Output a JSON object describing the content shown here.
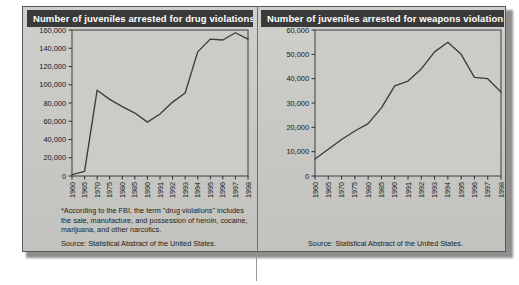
{
  "figure": {
    "panels": [
      {
        "id": "drug-violations",
        "title": "Number of juveniles arrested for drug violations*",
        "footnote": "*According to the FBI, the term \"drug violations\" includes the sale, manufacture, and possession of heroin, cocaine, marijuana, and other narcotics.",
        "source": "Source: Statistical Abstract of the United States."
      },
      {
        "id": "weapons-violations",
        "title": "Number of juveniles arrested for weapons violations",
        "footnote": "",
        "source": "Source: Statistical Abstract of the United States."
      }
    ],
    "colors": {
      "title_bar": "#3a3a3a",
      "title_text": "#ffffff",
      "panel_background": "#c9c9c5",
      "line": "#3c3c3c",
      "axis": "#3d3d3d",
      "frame_border": "#5a5a58"
    }
  },
  "chart_data": [
    {
      "type": "line",
      "title": "Number of juveniles arrested for drug violations*",
      "xlabel": "",
      "ylabel": "",
      "ylim": [
        0,
        160000
      ],
      "yticks": [
        0,
        20000,
        40000,
        60000,
        80000,
        100000,
        120000,
        140000,
        160000
      ],
      "ytick_labels": [
        "0",
        "20,000",
        "40,000",
        "60,000",
        "80,000",
        "100,000",
        "120,000",
        "140,000",
        "160,000"
      ],
      "categories": [
        "1960",
        "1965",
        "1970",
        "1975",
        "1980",
        "1985",
        "1990",
        "1991",
        "1992",
        "1993",
        "1994",
        "1995",
        "1996",
        "1997",
        "1998"
      ],
      "values": [
        1500,
        5000,
        94000,
        84000,
        76000,
        69000,
        59000,
        68000,
        81000,
        91000,
        136000,
        150000,
        149000,
        157000,
        150000
      ],
      "grid": false,
      "legend": "none",
      "annotations": [
        "*According to the FBI, the term \"drug violations\" includes the sale, manufacture, and possession of heroin, cocaine, marijuana, and other narcotics.",
        "Source: Statistical Abstract of the United States."
      ]
    },
    {
      "type": "line",
      "title": "Number of juveniles arrested for weapons violations",
      "xlabel": "",
      "ylabel": "",
      "ylim": [
        0,
        60000
      ],
      "yticks": [
        0,
        10000,
        20000,
        30000,
        40000,
        50000,
        60000
      ],
      "ytick_labels": [
        "0",
        "10,000",
        "20,000",
        "30,000",
        "40,000",
        "50,000",
        "60,000"
      ],
      "categories": [
        "1960",
        "1965",
        "1970",
        "1975",
        "1980",
        "1985",
        "1990",
        "1991",
        "1992",
        "1993",
        "1994",
        "1995",
        "1996",
        "1997",
        "1998"
      ],
      "values": [
        7000,
        11000,
        15000,
        18500,
        21500,
        28000,
        37000,
        39000,
        44000,
        51000,
        55000,
        50000,
        40500,
        40000,
        34500
      ],
      "grid": false,
      "legend": "none",
      "annotations": [
        "Source: Statistical Abstract of the United States."
      ]
    }
  ]
}
